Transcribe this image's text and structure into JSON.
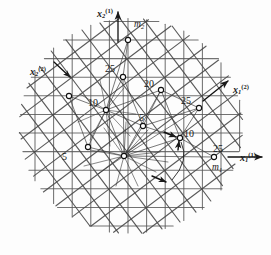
{
  "figure": {
    "background_color": "#fdfdfd",
    "ink_color": "#2a2a2a",
    "line_color": "#555555",
    "node_fill": "#ffffff"
  },
  "axes": [
    {
      "id": "x2-1",
      "label_base": "x",
      "sub": "2",
      "sup": "(1)",
      "x": 97,
      "y": 8,
      "arrow": "up",
      "desc": "vertical axis of lattice 1"
    },
    {
      "id": "x1-1",
      "label_base": "x",
      "sub": "1",
      "sup": "(1)",
      "x": 240,
      "y": 152,
      "arrow": "right",
      "desc": "horizontal axis of lattice 1"
    },
    {
      "id": "x1-2",
      "label_base": "x",
      "sub": "1",
      "sup": "(2)",
      "x": 233,
      "y": 84,
      "arrow": "up-right",
      "desc": "first axis of rotated lattice 2"
    },
    {
      "id": "x2-2",
      "label_base": "x",
      "sub": "2",
      "sup": "(2)",
      "x": 30,
      "y": 66,
      "arrow": "up-left",
      "desc": "second axis of rotated lattice 2"
    }
  ],
  "vectors": [
    {
      "id": "m2",
      "label_base": "m",
      "sub": "2",
      "x": 134,
      "y": 20,
      "desc": "lattice vector m2 at top node"
    },
    {
      "id": "m1",
      "label_base": "m",
      "sub": "1",
      "x": 212,
      "y": 163,
      "desc": "lattice vector m1 at right node"
    }
  ],
  "sigma_nodes": [
    {
      "value": "25",
      "node_x": 123,
      "node_y": 77,
      "label_x": 105,
      "label_y": 64
    },
    {
      "value": "20",
      "node_x": 161,
      "node_y": 90,
      "label_x": 144,
      "label_y": 79
    },
    {
      "value": "25",
      "node_x": 199,
      "node_y": 108,
      "label_x": 181,
      "label_y": 96
    },
    {
      "value": "10",
      "node_x": 106,
      "node_y": 110,
      "label_x": 88,
      "label_y": 98
    },
    {
      "value": "5",
      "node_x": 143,
      "node_y": 126,
      "label_x": 139,
      "label_y": 113
    },
    {
      "value": "10",
      "node_x": 180,
      "node_y": 138,
      "label_x": 184,
      "label_y": 129
    },
    {
      "value": "5",
      "node_x": 88,
      "node_y": 147,
      "label_x": 62,
      "label_y": 152
    },
    {
      "value": "25",
      "node_x": 214,
      "node_y": 157,
      "label_x": 213,
      "label_y": 144
    }
  ],
  "unlabeled_nodes": [
    {
      "id": "node-m2",
      "x": 128,
      "y": 40,
      "desc": "top coincidence node labelled m2"
    },
    {
      "id": "node-left",
      "x": 69,
      "y": 96,
      "desc": "left coincidence node near x2(2) arrow"
    },
    {
      "id": "node-hub",
      "x": 124,
      "y": 156,
      "desc": "central hub node with radiating connections"
    }
  ],
  "lattice_1": {
    "description": "orthogonal square grid aligned with x1(1) and x2(1)",
    "spacing": 18.6,
    "angle_deg": 0,
    "line_color": "#5a5a5a"
  },
  "lattice_2": {
    "description": "square grid rotated relative to lattice 1",
    "spacing": 18.6,
    "angle_deg": 37,
    "line_color": "#4a4a4a"
  },
  "annotations": {
    "arrowheads_at_sigma10": 2,
    "curved_arc_at_sigma10": true
  }
}
